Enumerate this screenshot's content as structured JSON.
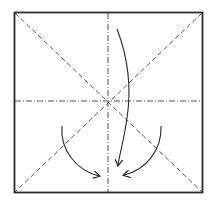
{
  "diagram": {
    "type": "origami-fold-diagram",
    "colors": {
      "background": "#ffffff",
      "stroke": "#2a2a2a",
      "fold_line": "#555555"
    },
    "square": {
      "x": 14,
      "y": 12,
      "width": 189,
      "height": 181
    },
    "center": {
      "x": 108,
      "y": 101
    },
    "lines": [
      {
        "name": "vertical-mountain-fold",
        "style": "dash-dot"
      },
      {
        "name": "horizontal-mountain-fold",
        "style": "dash-dot"
      },
      {
        "name": "diagonal-valley-fold-1",
        "style": "dashed"
      },
      {
        "name": "diagonal-valley-fold-2",
        "style": "dashed"
      }
    ],
    "arrows": [
      {
        "name": "long-arrow",
        "direction": "top-right curving down to bottom-center"
      },
      {
        "name": "left-arrow",
        "direction": "left curving down-right to bottom-center"
      },
      {
        "name": "right-arrow",
        "direction": "right curving down-left to bottom-center"
      }
    ]
  }
}
